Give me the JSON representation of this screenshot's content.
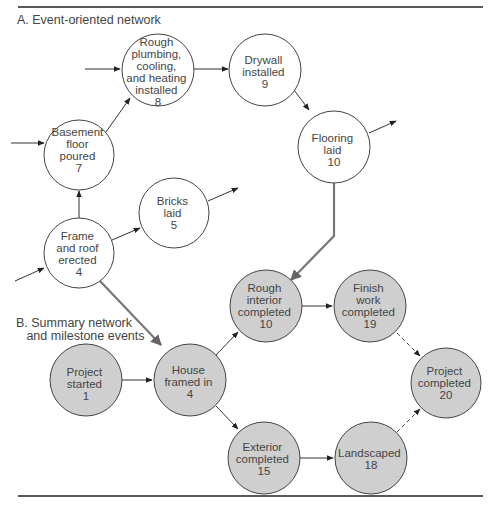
{
  "sections": {
    "a_label": "A. Event-oriented network",
    "b_label_line1": "B. Summary network",
    "b_label_line2": "   and milestone events"
  },
  "colors": {
    "event_node_fill": "#ffffff",
    "milestone_node_fill": "#cfcfcf",
    "line": "#333333",
    "link_line": "#777777"
  },
  "event_network": {
    "nodes": [
      {
        "id": "basement",
        "lines": [
          "Basement",
          "floor",
          "poured",
          "7"
        ]
      },
      {
        "id": "rough_plumbing",
        "lines": [
          "Rough",
          "plumbing,",
          "cooling,",
          "and heating",
          "installed",
          "8"
        ]
      },
      {
        "id": "drywall",
        "lines": [
          "Drywall",
          "installed",
          "9"
        ]
      },
      {
        "id": "flooring",
        "lines": [
          "Flooring",
          "laid",
          "10"
        ]
      },
      {
        "id": "frame",
        "lines": [
          "Frame",
          "and roof",
          "erected",
          "4"
        ]
      },
      {
        "id": "bricks",
        "lines": [
          "Bricks",
          "laid",
          "5"
        ]
      }
    ]
  },
  "summary_network": {
    "nodes": [
      {
        "id": "project_started",
        "lines": [
          "Project",
          "started",
          "1"
        ]
      },
      {
        "id": "house_framed",
        "lines": [
          "House",
          "framed in",
          "4"
        ]
      },
      {
        "id": "rough_interior",
        "lines": [
          "Rough",
          "interior",
          "completed",
          "10"
        ]
      },
      {
        "id": "finish_work",
        "lines": [
          "Finish",
          "work",
          "completed",
          "19"
        ]
      },
      {
        "id": "project_completed",
        "lines": [
          "Project",
          "completed",
          "20"
        ]
      },
      {
        "id": "exterior",
        "lines": [
          "Exterior",
          "completed",
          "15"
        ]
      },
      {
        "id": "landscaped",
        "lines": [
          "Landscaped",
          "18"
        ]
      }
    ]
  }
}
